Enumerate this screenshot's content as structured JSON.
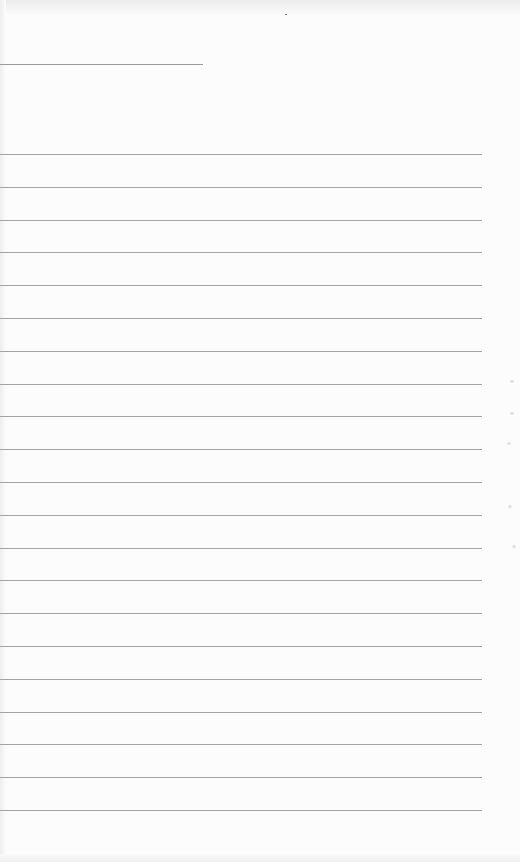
{
  "page": {
    "type": "lined-paper",
    "header_line": {
      "y": 64,
      "width": 203
    },
    "rules": {
      "count": 21,
      "first_y": 154,
      "spacing": 32.8,
      "width": 482
    },
    "colors": {
      "paper": "#fcfcfc",
      "rule": "#a4a4a4"
    }
  }
}
